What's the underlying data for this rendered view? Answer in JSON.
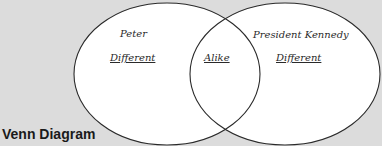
{
  "title": "Venn Diagram",
  "circles": {
    "left": {
      "name": "Peter",
      "region_label": "Different"
    },
    "right": {
      "name": "President Kennedy",
      "region_label": "Different"
    },
    "overlap": {
      "region_label": "Alike"
    }
  },
  "colors": {
    "background": "#dcdcdc",
    "circle_fill": "#ffffff",
    "circle_stroke": "#2a2a2a"
  }
}
